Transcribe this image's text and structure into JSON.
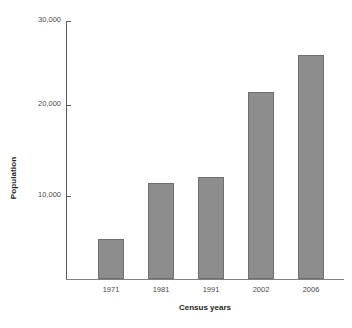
{
  "chart_data": {
    "type": "bar",
    "title": "",
    "xlabel": "Census years",
    "ylabel": "Population",
    "categories": [
      "1971",
      "1981",
      "1991",
      "2002",
      "2006"
    ],
    "values": [
      4700,
      11200,
      11900,
      21700,
      26000
    ],
    "series": [
      {
        "name": "Population",
        "values": [
          4700,
          11200,
          11900,
          21700,
          26000
        ]
      }
    ],
    "ylim": [
      0,
      30000
    ],
    "yticks": [
      10000,
      20000,
      30000
    ],
    "ytick_labels": [
      "10,000",
      "20,000",
      "30,000"
    ],
    "xtick_labels": [
      "1971",
      "1981",
      "1991",
      "2002",
      "2006"
    ],
    "grid": false,
    "legend": null,
    "legend_position": "none",
    "bar_color": "#8d8d8d",
    "bar_edge_color": "#6f6f6f",
    "axis_color": "#58595b",
    "text_color": "#231f20"
  },
  "axes": {
    "y_title": "Population",
    "x_title": "Census years"
  }
}
